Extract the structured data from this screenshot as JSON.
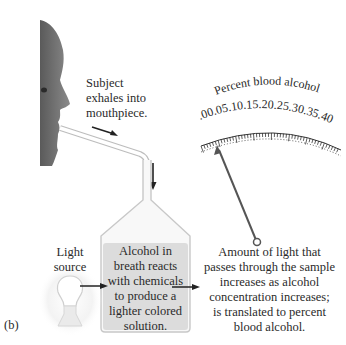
{
  "figure": {
    "panel_label": "(b)",
    "subject_caption": [
      "Subject",
      "exhales into",
      "mouthpiece."
    ],
    "light_label": [
      "Light",
      "source"
    ],
    "chamber_text": [
      "Alcohol in",
      "breath reacts",
      "with chemicals",
      "to produce a",
      "lighter colored",
      "solution."
    ],
    "result_text": [
      "Amount of light that",
      "passes through the sample",
      "increases as alcohol",
      "concentration increases;",
      "is translated to percent",
      "blood alcohol."
    ],
    "gauge": {
      "title": "Percent blood alcohol",
      "ticks": [
        ".00",
        ".05",
        ".10",
        ".15",
        ".20",
        ".25",
        ".30",
        ".35",
        ".40"
      ],
      "needle_value": ".05"
    }
  },
  "colors": {
    "liquid": "#dcdcdc",
    "glass": "#bdbdbd",
    "text": "#2a2a2a",
    "needle": "#555555"
  }
}
